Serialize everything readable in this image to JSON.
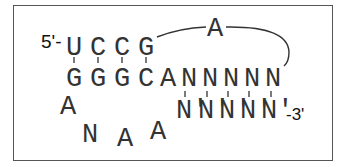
{
  "diagram": {
    "type": "rna-secondary-structure",
    "five_prime_label": "5'-",
    "three_prime_label": "-3'",
    "top_strand": [
      "U",
      "C",
      "C",
      "G"
    ],
    "bottom_strand": [
      "G",
      "G",
      "G",
      "C",
      "A",
      "N",
      "N",
      "N",
      "N",
      "N",
      "N"
    ],
    "bridge_nucleotide": "A",
    "loop": [
      "A",
      "N",
      "A",
      "A"
    ],
    "paired_strand": [
      "N'",
      "N'",
      "N'",
      "N'",
      "N'"
    ],
    "paired_strand_tail": "N'",
    "colors": {
      "text": "#333333",
      "border": "#555555",
      "background": "#ffffff"
    }
  }
}
